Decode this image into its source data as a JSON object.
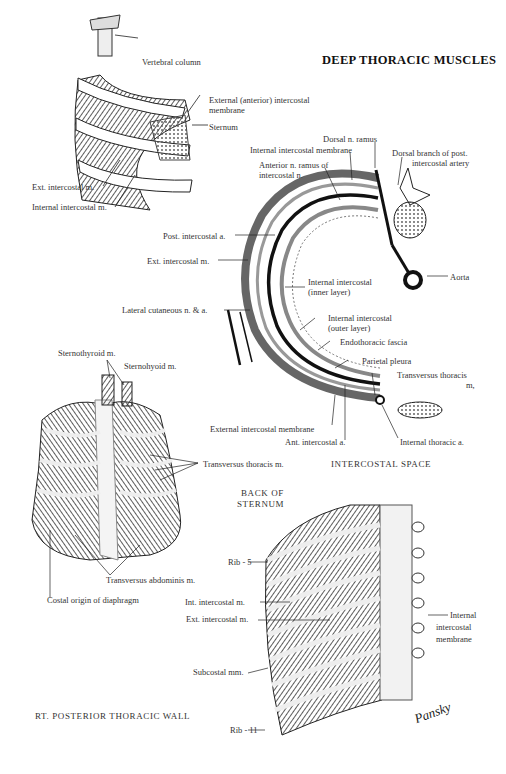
{
  "page": {
    "title": "DEEP THORACIC MUSCLES",
    "signature": "Pansky"
  },
  "figures": [
    {
      "name": "rib-cage-segment",
      "labels": {
        "vertebral_column": "Vertebral column",
        "external_membrane_1": "External (anterior) intercostal",
        "external_membrane_2": "membrane",
        "sternum": "Sternum",
        "ext_intercostal": "Ext. intercostal m.",
        "int_intercostal": "Internal intercostal m."
      }
    },
    {
      "name": "intercostal-space",
      "caption": "INTERCOSTAL SPACE",
      "labels": {
        "dorsal_ramus": "Dorsal n. ramus",
        "int_membrane": "Internal intercostal membrane",
        "dorsal_branch_1": "Dorsal branch of post.",
        "dorsal_branch_2": "intercostal artery",
        "anterior_ramus_1": "Anterior n. ramus of",
        "anterior_ramus_2": "intercostal n.",
        "post_intercostal_a": "Post. intercostal a.",
        "ext_intercostal": "Ext. intercostal m.",
        "aorta": "Aorta",
        "int_inner_1": "Internal intercostal",
        "int_inner_2": "(inner layer)",
        "lateral_cutaneous": "Lateral cutaneous n. & a.",
        "int_outer_1": "Internal intercostal",
        "int_outer_2": "(outer layer)",
        "endothoracic": "Endothoracic fascia",
        "parietal_pleura": "Parietal pleura",
        "transversus_1": "Transversus thoracis",
        "transversus_2": "m,",
        "ext_membrane": "External intercostal  membrane",
        "ant_intercostal_a": "Ant. intercostal a.",
        "internal_thoracic_a": "Internal thoracic a."
      }
    },
    {
      "name": "back-of-sternum",
      "caption_1": "BACK OF",
      "caption_2": "STERNUM",
      "labels": {
        "sternothyroid": "Sternothyroid m.",
        "sternohyoid": "Sternohyoid m.",
        "transversus_thoracis": "Transversus thoracis m.",
        "transversus_abdominis": "Transversus abdominis m.",
        "costal_origin": "Costal origin of diaphragm"
      }
    },
    {
      "name": "posterior-thoracic-wall",
      "caption": "RT. POSTERIOR THORACIC WALL",
      "labels": {
        "rib5": "Rib - 5",
        "int_intercostal": "Int. intercostal m.",
        "ext_intercostal": "Ext. intercostal m.",
        "int_membrane_1": "Internal",
        "int_membrane_2": "intercostal",
        "int_membrane_3": "membrane",
        "subcostal": "Subcostal mm.",
        "rib11": "Rib - 11"
      }
    }
  ]
}
